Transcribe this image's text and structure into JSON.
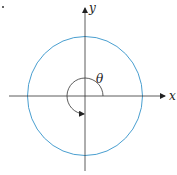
{
  "diagram": {
    "type": "unit-circle-angle",
    "labels": {
      "x_axis": "x",
      "y_axis": "y",
      "angle": "θ"
    },
    "angle_degrees": 270,
    "angle_direction": "counterclockwise",
    "colors": {
      "circle": "#4a9fd0",
      "axes": "#333333",
      "arc": "#333333",
      "background": "#ffffff"
    }
  }
}
